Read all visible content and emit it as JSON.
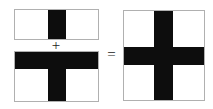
{
  "diagram": {
    "background_color": "#ffffff",
    "fill_color": "#0d0d0d",
    "outline_color": "#b0b0b0",
    "operators": {
      "plus": "+",
      "equals": "="
    },
    "operands": [
      {
        "id": "operand-a",
        "label": "rectangle-with-vertical-band",
        "shape": "rectangle",
        "parts": [
          {
            "name": "vertical-band",
            "orientation": "vertical"
          }
        ]
      },
      {
        "id": "operand-b",
        "label": "rectangle-with-t-shape",
        "shape": "rectangle",
        "parts": [
          {
            "name": "horizontal-band",
            "orientation": "horizontal"
          },
          {
            "name": "vertical-stem",
            "orientation": "vertical"
          }
        ]
      }
    ],
    "result": {
      "id": "result-shape",
      "label": "square-with-cross",
      "shape": "square",
      "parts": [
        {
          "name": "vertical-band",
          "orientation": "vertical"
        },
        {
          "name": "horizontal-band",
          "orientation": "horizontal"
        }
      ]
    }
  }
}
